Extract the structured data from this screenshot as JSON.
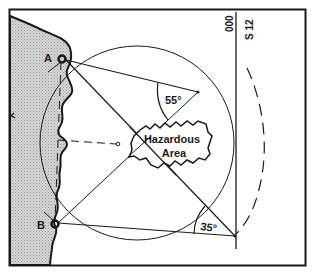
{
  "diagram": {
    "colors": {
      "ink": "#1a1a1a",
      "land_fill": "#c8c8c8",
      "background": "#ffffff"
    },
    "points": {
      "a_label": "A",
      "b_label": "B"
    },
    "hazard": {
      "line1": "Hazardous",
      "line2": "Area"
    },
    "angles": {
      "horizontal_danger_angle": "55°",
      "vertical_danger_angle": "35°"
    },
    "heading": {
      "course": "000",
      "speed": "S 12"
    },
    "land_marker": "x"
  }
}
